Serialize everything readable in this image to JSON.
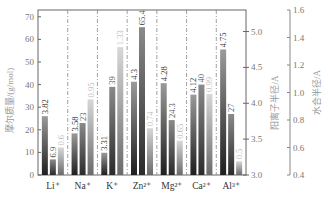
{
  "chart_data": {
    "type": "bar",
    "title": "",
    "categories": [
      "Li⁺",
      "Na⁺",
      "K⁺",
      "Zn²⁺",
      "Mg²⁺",
      "Ca²⁺",
      "Al³⁺"
    ],
    "series": [
      {
        "name": "阳离子半径/Å",
        "axis": "right-inner",
        "values": [
          3.82,
          3.58,
          3.31,
          4.3,
          4.28,
          4.12,
          4.75
        ],
        "labels": [
          "3.82",
          "3.58",
          "3.31",
          "4.3",
          "4.28",
          "4.12",
          "4.75"
        ],
        "color": "#555555"
      },
      {
        "name": "摩尔质量/(g/mol)",
        "axis": "left",
        "values": [
          6.9,
          23,
          39,
          65.4,
          24.3,
          40,
          27
        ],
        "labels": [
          "6.9",
          "23",
          "39",
          "65.4",
          "24.3",
          "40",
          "27"
        ],
        "color": "#666666"
      },
      {
        "name": "水合半径/Å",
        "axis": "right-outer",
        "values": [
          0.6,
          0.95,
          1.33,
          0.74,
          0.65,
          0.99,
          0.5
        ],
        "labels": [
          "0.6",
          "0.95",
          "1.33",
          "0.74",
          "0.65",
          "0.99",
          "0.5"
        ],
        "color": "#aaaaaa"
      }
    ],
    "axes": {
      "left": {
        "label": "摩尔质量/(g/mol)",
        "ticks": [
          "0",
          "10",
          "20",
          "30",
          "40",
          "50",
          "60",
          "70"
        ],
        "ylim": [
          0,
          73
        ]
      },
      "right_inner": {
        "label": "阳离子半径/Å",
        "ticks": [
          "3.0",
          "3.5",
          "4.0",
          "4.5",
          "5.0"
        ],
        "ylim": [
          3.0,
          5.3
        ]
      },
      "right_outer": {
        "label": "水合半径/Å",
        "ticks": [
          "0.4",
          "0.6",
          "0.8",
          "1.0",
          "1.2",
          "1.4",
          "1.6"
        ],
        "ylim": [
          0.4,
          1.6
        ]
      }
    },
    "grid": false,
    "separators": "dash-dot vertical lines between groups",
    "legend": "none",
    "caption": ""
  }
}
